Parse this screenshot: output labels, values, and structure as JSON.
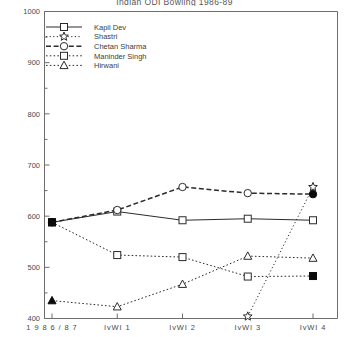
{
  "chart_data": {
    "type": "line",
    "title": "Indian ODI Bowling 1986-89",
    "xlabel": "",
    "ylabel": "",
    "categories": [
      "1986/87",
      "IvWI 1",
      "IvWI 2",
      "IvWI 3",
      "IvWI 4"
    ],
    "ylim": [
      400,
      1000
    ],
    "yticks": [
      400,
      500,
      600,
      700,
      800,
      900,
      1000
    ],
    "yminorticks": [
      450,
      550,
      650,
      750,
      850,
      950
    ],
    "grid": false,
    "legend_position": "top-left",
    "series": [
      {
        "name": "Kapil Dev",
        "marker": "square-open",
        "linestyle": "solid",
        "values": [
          588,
          609,
          592,
          595,
          592
        ]
      },
      {
        "name": "Shastri",
        "marker": "star-open",
        "linestyle": "dotted-fine",
        "values": [
          null,
          null,
          null,
          404,
          657
        ]
      },
      {
        "name": "Chetan Sharma",
        "marker": "circle-open",
        "linestyle": "dashed",
        "values": [
          588,
          612,
          657,
          645,
          643
        ]
      },
      {
        "name": "Maninder Singh",
        "marker": "square-open",
        "linestyle": "dotted",
        "values": [
          588,
          524,
          520,
          482,
          483
        ]
      },
      {
        "name": "Hirwani",
        "marker": "triangle-open",
        "linestyle": "dotted",
        "values": [
          435,
          423,
          467,
          522,
          518
        ]
      }
    ],
    "filled_endpoints": {
      "note": "First point of several series and last points drawn as solid filled markers",
      "items": [
        {
          "series": "Kapil Dev",
          "index": 0,
          "value": 588
        },
        {
          "series": "Maninder Singh",
          "index": 0,
          "value": 588
        },
        {
          "series": "Chetan Sharma",
          "index": 0,
          "value": 588
        },
        {
          "series": "Hirwani",
          "index": 0,
          "value": 435
        },
        {
          "series": "Chetan Sharma",
          "index": 4,
          "value": 643
        },
        {
          "series": "Maninder Singh",
          "index": 4,
          "value": 483
        }
      ]
    }
  },
  "legend": {
    "items": [
      {
        "label": "Kapil Dev"
      },
      {
        "label": "Shastri"
      },
      {
        "label": "Chetan Sharma"
      },
      {
        "label": "Maninder Singh"
      },
      {
        "label": "Hirwani"
      }
    ]
  },
  "axis": {
    "y_tick_labels": [
      "1000",
      "900",
      "800",
      "700",
      "600",
      "500",
      "400"
    ],
    "x_tick_labels": [
      "1 9 8 6 / 8 7",
      "IvWI  1",
      "IvWI  2",
      "IvWI  3",
      "IvWI  4"
    ]
  }
}
